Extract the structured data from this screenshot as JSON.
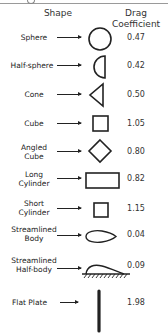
{
  "header": {
    "shape_label": "Shape",
    "drag_label_line1": "Drag",
    "drag_label_line2": "Coefficient"
  },
  "rows": [
    {
      "name": "Sphere",
      "shape": "circle-icon",
      "cd": "0.47"
    },
    {
      "name": "Half-sphere",
      "shape": "half-sphere-icon",
      "cd": "0.42"
    },
    {
      "name": "Cone",
      "shape": "cone-icon",
      "cd": "0.50"
    },
    {
      "name": "Cube",
      "shape": "square-icon",
      "cd": "1.05"
    },
    {
      "name_line1": "Angled",
      "name_line2": "Cube",
      "shape": "diamond-icon",
      "cd": "0.80"
    },
    {
      "name_line1": "Long",
      "name_line2": "Cylinder",
      "shape": "long-rectangle-icon",
      "cd": "0.82"
    },
    {
      "name_line1": "Short",
      "name_line2": "Cylinder",
      "shape": "square-icon",
      "cd": "1.15"
    },
    {
      "name_line1": "Streamlined",
      "name_line2": "Body",
      "shape": "airfoil-icon",
      "cd": "0.04"
    },
    {
      "name_line1": "Streamlined",
      "name_line2": "Half-body",
      "shape": "half-airfoil-icon",
      "cd": "0.09"
    },
    {
      "name": "Flat Plate",
      "shape": "flat-plate-icon",
      "cd": "1.98"
    }
  ],
  "colors": {
    "stroke": "#222222",
    "text": "#222222",
    "background": "#ffffff"
  }
}
